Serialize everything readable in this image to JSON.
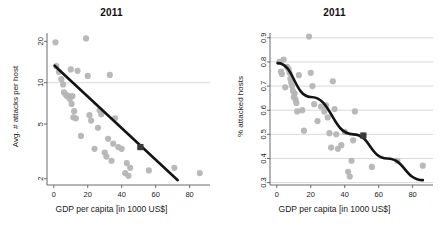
{
  "figure": {
    "panels": [
      {
        "id": "left",
        "title": "2011",
        "xlabel": "GDP per capita [in 1000 US$]",
        "ylabel": "Avg. # attacks per host"
      },
      {
        "id": "right",
        "title": "2011",
        "xlabel": "GDP per capita [in 1000 US$]",
        "ylabel": "% attacked hosts"
      }
    ],
    "colors": {
      "point": "#b5b5b5",
      "highlight": "#3a3a3a",
      "fit_line": "#141414",
      "grid": "#cfcfcf",
      "axis": "#5a5a5a",
      "background": "#ffffff",
      "text": "#1a1a1a"
    }
  },
  "chart_data": [
    {
      "type": "scatter",
      "panel": "left",
      "title": "2011",
      "xlabel": "GDP per capita [in 1000 US$]",
      "ylabel": "Avg. # attacks per host",
      "xlim": [
        -4,
        92
      ],
      "ylim": [
        1.8,
        23
      ],
      "yscale": "log",
      "xscale": "linear",
      "xticks": [
        0,
        20,
        40,
        60,
        80
      ],
      "yticks": [
        2,
        5,
        10,
        20
      ],
      "ytick_labels": [
        "2",
        "5",
        "10",
        "20"
      ],
      "grid": "y-gridline at 10 only",
      "legend": "none",
      "series": [
        {
          "name": "countries",
          "marker": "filled-circle-gray",
          "points": [
            [
              1.0,
              19.7
            ],
            [
              1.5,
              13.2
            ],
            [
              3.0,
              12.0
            ],
            [
              4.5,
              10.6
            ],
            [
              5.5,
              9.7
            ],
            [
              6.0,
              8.5
            ],
            [
              7.0,
              8.2
            ],
            [
              7.5,
              8.1
            ],
            [
              8.0,
              8.0
            ],
            [
              8.5,
              7.9
            ],
            [
              9.0,
              8.0
            ],
            [
              9.5,
              7.6
            ],
            [
              10.0,
              12.5
            ],
            [
              10.5,
              7.0
            ],
            [
              11.0,
              8.0
            ],
            [
              11.5,
              5.6
            ],
            [
              12.0,
              6.2
            ],
            [
              13.0,
              5.5
            ],
            [
              14.0,
              12.2
            ],
            [
              16.0,
              4.1
            ],
            [
              19.0,
              21.0
            ],
            [
              20.0,
              11.2
            ],
            [
              21.0,
              5.8
            ],
            [
              22.0,
              5.3
            ],
            [
              24.0,
              3.3
            ],
            [
              26.0,
              4.7
            ],
            [
              27.0,
              6.3
            ],
            [
              28.0,
              5.9
            ],
            [
              30.0,
              3.1
            ],
            [
              31.0,
              2.9
            ],
            [
              32.0,
              3.9
            ],
            [
              33.0,
              11.4
            ],
            [
              34.0,
              2.7
            ],
            [
              35.0,
              3.6
            ],
            [
              36.0,
              5.5
            ],
            [
              38.0,
              3.4
            ],
            [
              40.0,
              3.3
            ],
            [
              42.0,
              2.2
            ],
            [
              43.0,
              2.6
            ],
            [
              44.0,
              2.1
            ],
            [
              45.0,
              2.4
            ],
            [
              51.0,
              3.4
            ],
            [
              56.0,
              2.3
            ],
            [
              71.0,
              2.4
            ],
            [
              86.0,
              2.2
            ]
          ]
        },
        {
          "name": "highlighted country",
          "marker": "filled-square-dark",
          "points": [
            [
              51.0,
              3.4
            ]
          ]
        }
      ],
      "fit": {
        "name": "log-linear fit",
        "style": "solid thick black line",
        "endpoints": [
          [
            0.5,
            13.3
          ],
          [
            73.0,
            1.95
          ]
        ]
      }
    },
    {
      "type": "scatter",
      "panel": "right",
      "title": "2011",
      "xlabel": "GDP per capita [in 1000 US$]",
      "ylabel": "% attacked hosts",
      "xlim": [
        -4,
        92
      ],
      "ylim": [
        0.29,
        0.92
      ],
      "yscale": "linear",
      "xscale": "linear",
      "xticks": [
        0,
        20,
        40,
        60,
        80
      ],
      "yticks": [
        0.3,
        0.4,
        0.5,
        0.6,
        0.7,
        0.8,
        0.9
      ],
      "ytick_labels": [
        "0.3",
        "0.4",
        "0.5",
        "0.6",
        "0.7",
        "0.8",
        "0.9"
      ],
      "grid": "horizontal gridlines at every y tick",
      "legend": "none",
      "series": [
        {
          "name": "countries",
          "marker": "filled-circle-gray",
          "points": [
            [
              1.5,
              0.8
            ],
            [
              2.5,
              0.76
            ],
            [
              3.0,
              0.75
            ],
            [
              4.0,
              0.81
            ],
            [
              5.0,
              0.695
            ],
            [
              6.0,
              0.78
            ],
            [
              7.0,
              0.77
            ],
            [
              7.5,
              0.755
            ],
            [
              8.0,
              0.73
            ],
            [
              8.5,
              0.715
            ],
            [
              9.0,
              0.7
            ],
            [
              9.5,
              0.68
            ],
            [
              10.0,
              0.655
            ],
            [
              10.5,
              0.67
            ],
            [
              11.0,
              0.645
            ],
            [
              11.5,
              0.63
            ],
            [
              12.0,
              0.595
            ],
            [
              13.0,
              0.745
            ],
            [
              15.0,
              0.6
            ],
            [
              16.0,
              0.515
            ],
            [
              19.0,
              0.905
            ],
            [
              20.0,
              0.755
            ],
            [
              21.0,
              0.7
            ],
            [
              22.0,
              0.625
            ],
            [
              24.0,
              0.555
            ],
            [
              26.0,
              0.615
            ],
            [
              28.0,
              0.595
            ],
            [
              29.0,
              0.62
            ],
            [
              30.0,
              0.57
            ],
            [
              31.0,
              0.505
            ],
            [
              32.0,
              0.445
            ],
            [
              33.0,
              0.72
            ],
            [
              34.0,
              0.605
            ],
            [
              35.0,
              0.5
            ],
            [
              36.0,
              0.44
            ],
            [
              38.0,
              0.455
            ],
            [
              40.0,
              0.51
            ],
            [
              42.0,
              0.345
            ],
            [
              43.0,
              0.325
            ],
            [
              44.0,
              0.39
            ],
            [
              45.0,
              0.475
            ],
            [
              46.0,
              0.595
            ],
            [
              51.0,
              0.495
            ],
            [
              56.0,
              0.365
            ],
            [
              71.0,
              0.39
            ],
            [
              86.0,
              0.37
            ]
          ]
        },
        {
          "name": "highlighted country",
          "marker": "filled-square-dark",
          "points": [
            [
              51.0,
              0.495
            ]
          ]
        }
      ],
      "fit": {
        "name": "exponential decay fit",
        "style": "solid thick black curve",
        "endpoints": [
          [
            0.5,
            0.795
          ],
          [
            86.0,
            0.31
          ]
        ],
        "control": [
          [
            20.0,
            0.655
          ],
          [
            45.0,
            0.5
          ],
          [
            65.0,
            0.4
          ]
        ]
      }
    }
  ]
}
